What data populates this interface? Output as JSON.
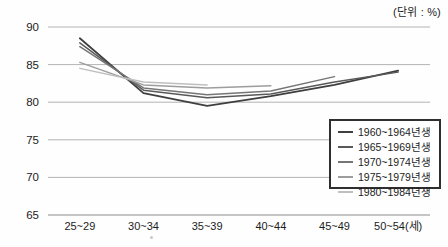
{
  "unit_label": "(단위 : %)",
  "chart_data": {
    "type": "line",
    "title": "",
    "xlabel": "",
    "ylabel": "",
    "unit": "(단위 : %)",
    "categories": [
      "25~29",
      "30~34",
      "35~39",
      "40~44",
      "45~49",
      "50~54(세)"
    ],
    "series": [
      {
        "name": "1960~1964년생",
        "color": "#3f3f3f",
        "width": 1.8,
        "values": [
          88.5,
          81.2,
          79.5,
          80.8,
          82.3,
          84.2
        ]
      },
      {
        "name": "1965~1969년생",
        "color": "#595959",
        "width": 1.5,
        "values": [
          87.9,
          81.6,
          80.6,
          81.1,
          82.7,
          84.0
        ]
      },
      {
        "name": "1970~1974년생",
        "color": "#767676",
        "width": 1.5,
        "values": [
          87.4,
          81.9,
          81.0,
          81.5,
          83.4,
          null
        ]
      },
      {
        "name": "1975~1979년생",
        "color": "#9d9d9d",
        "width": 1.5,
        "values": [
          85.3,
          82.3,
          81.9,
          82.2,
          null,
          null
        ]
      },
      {
        "name": "1980~1984년생",
        "color": "#bfbfbf",
        "width": 1.5,
        "values": [
          84.5,
          82.7,
          82.3,
          null,
          null,
          null
        ]
      }
    ],
    "ylim": [
      65,
      90
    ],
    "yticks": [
      90,
      85,
      80,
      75,
      70,
      65
    ],
    "grid": true,
    "gridline_color": "#b3b3b3",
    "axis_line_color": "#8c8c8c",
    "tick_label_color": "#1c1c1c",
    "legend_position": "bottom-right"
  }
}
